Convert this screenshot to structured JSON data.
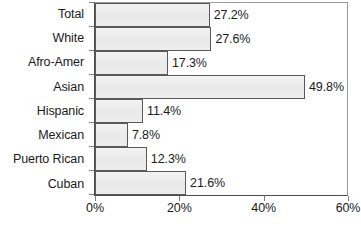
{
  "chart_data": {
    "type": "bar",
    "orientation": "horizontal",
    "title": "",
    "subtitle": "",
    "xlabel": "",
    "ylabel": "",
    "categories": [
      "Total",
      "White",
      "Afro-Amer",
      "Asian",
      "Hispanic",
      "Mexican",
      "Puerto Rican",
      "Cuban"
    ],
    "values": [
      27.2,
      27.6,
      17.3,
      49.8,
      11.4,
      7.8,
      12.3,
      21.6
    ],
    "data_labels": [
      "27.2%",
      "27.6%",
      "17.3%",
      "49.8%",
      "11.4%",
      "7.8%",
      "12.3%",
      "21.6%"
    ],
    "xlim": [
      0,
      60
    ],
    "x_tick_values": [
      0,
      20,
      40,
      60
    ],
    "x_tick_labels": [
      "0%",
      "20%",
      "40%",
      "60%"
    ],
    "grid": false,
    "legend": false,
    "legend_position": "none",
    "bar_fill_color": "#ededed",
    "bar_border_color": "#595959",
    "axis_color": "#4d4d4d",
    "text_color": "#1a1a1a",
    "background_color": "#ffffff"
  }
}
